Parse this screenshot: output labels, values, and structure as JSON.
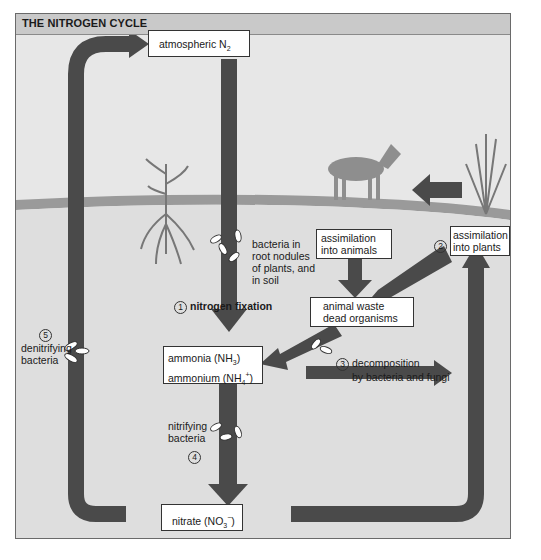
{
  "title": "THE NITROGEN CYCLE",
  "nodes": {
    "atmospheric": {
      "text": "atmospheric N",
      "sub": "2"
    },
    "ammonia": {
      "line1": "ammonia (NH",
      "line1_sub": "3",
      "line1_end": ")",
      "line2": "ammonium (NH",
      "line2_sub": "4",
      "line2_sup": "+",
      "line2_end": ")"
    },
    "nitrate": {
      "text": "nitrate (NO",
      "sub": "3",
      "sup": "−",
      "end": ")"
    },
    "assim_animals": {
      "line1": "assimilation",
      "line2": "into animals"
    },
    "assim_plants": {
      "line1": "assimilation",
      "line2": "into plants"
    },
    "waste": {
      "line1": "animal waste",
      "line2": "dead organisms"
    }
  },
  "labels": {
    "root_bacteria": [
      "bacteria in",
      "root nodules",
      "of plants, and",
      "in soil"
    ],
    "fixation": {
      "num": "1",
      "text": "nitrogen fixation"
    },
    "step2": {
      "num": "2"
    },
    "decomposition": {
      "num": "3",
      "line1": "decomposition",
      "line2": "by bacteria and fungi"
    },
    "nitrifying": {
      "num": "4",
      "line1": "nitrifying",
      "line2": "bacteria"
    },
    "denitrifying": {
      "num": "5",
      "line1": "denitrifying",
      "line2": "bacteria"
    }
  },
  "colors": {
    "arrow": "#4a4a4a",
    "ground": "#9a9a9a",
    "background": "#e7e7e7",
    "title_bar": "#c9c9c9"
  }
}
